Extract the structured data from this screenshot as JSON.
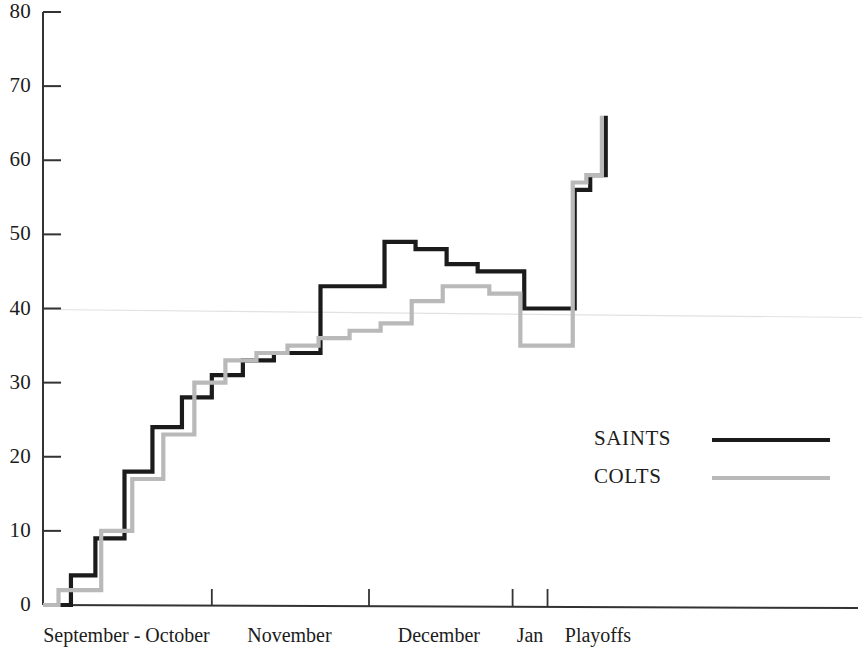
{
  "chart_data": {
    "type": "line",
    "title": "",
    "subtitle": "",
    "xlabel": "",
    "ylabel": "",
    "step_style": "post",
    "grid": false,
    "gridlines": [
      40
    ],
    "legend_position": "center-right",
    "ylim": [
      0,
      80
    ],
    "yticks": [
      0,
      10,
      20,
      30,
      40,
      50,
      60,
      70,
      80
    ],
    "ytick_labels": [
      "0",
      "10",
      "20",
      "30",
      "40",
      "50",
      "60",
      "70",
      "80"
    ],
    "xlim": [
      0,
      21
    ],
    "xtick_positions": [
      4.35,
      8.4,
      12.1,
      13.0
    ],
    "xtick_labels": [],
    "x_section_labels": [
      {
        "label": "September - October",
        "center_x": 2.15
      },
      {
        "label": "November",
        "center_x": 6.35
      },
      {
        "label": "December",
        "center_x": 10.2
      },
      {
        "label": "Jan",
        "center_x": 12.55
      },
      {
        "label": "Playoffs",
        "center_x": 14.3
      }
    ],
    "series": [
      {
        "name": "SAINTS",
        "color": "#1b1b1b",
        "linewidth": 4.2,
        "x": [
          0.0,
          0.3,
          0.52,
          0.72,
          0.95,
          1.35,
          1.72,
          2.1,
          2.45,
          2.82,
          3.2,
          3.58,
          3.95,
          4.35,
          4.75,
          5.15,
          5.55,
          5.95,
          6.35,
          6.75,
          7.15,
          7.55,
          8.0,
          8.4,
          8.8,
          9.2,
          9.6,
          10.0,
          10.4,
          10.8,
          11.2,
          11.6,
          12.0,
          12.4,
          12.8,
          13.0,
          13.3,
          13.7,
          14.1,
          14.5
        ],
        "y": [
          0,
          0,
          0,
          4,
          4,
          9,
          9,
          18,
          18,
          24,
          24,
          28,
          28,
          31,
          31,
          33,
          33,
          34,
          34,
          34,
          43,
          43,
          43,
          43,
          49,
          49,
          48,
          48,
          46,
          46,
          45,
          45,
          45,
          40,
          40,
          40,
          40,
          56,
          58,
          66
        ]
      },
      {
        "name": "COLTS",
        "color": "#b9b9b9",
        "linewidth": 4.2,
        "x": [
          0.0,
          0.18,
          0.4,
          0.72,
          1.1,
          1.5,
          1.9,
          2.3,
          2.7,
          3.1,
          3.5,
          3.9,
          4.3,
          4.7,
          5.1,
          5.5,
          5.9,
          6.3,
          6.7,
          7.1,
          7.5,
          7.9,
          8.3,
          8.7,
          9.1,
          9.5,
          9.9,
          10.3,
          10.7,
          11.1,
          11.5,
          11.9,
          12.3,
          12.7,
          13.0,
          13.3,
          13.65,
          14.0,
          14.4
        ],
        "y": [
          0,
          0,
          2,
          2,
          2,
          10,
          10,
          17,
          17,
          23,
          23,
          30,
          30,
          33,
          33,
          34,
          34,
          35,
          35,
          36,
          36,
          37,
          37,
          38,
          38,
          41,
          41,
          43,
          43,
          43,
          42,
          42,
          35,
          35,
          35,
          35,
          57,
          58,
          66
        ]
      }
    ],
    "legend": [
      {
        "label": "SAINTS",
        "color": "#1b1b1b"
      },
      {
        "label": "COLTS",
        "color": "#b9b9b9"
      }
    ]
  },
  "axes": {
    "axis_color": "#333333",
    "gridline_color": "#e2e2e2"
  }
}
